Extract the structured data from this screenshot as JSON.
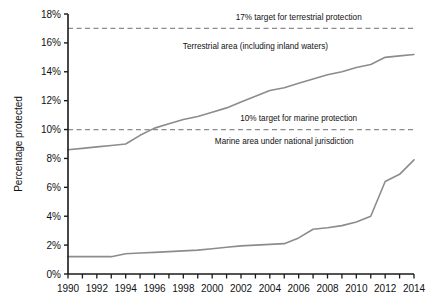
{
  "chart_data": {
    "type": "line",
    "title": "",
    "xlabel": "",
    "ylabel": "Percentage protected",
    "xlim": [
      1990,
      2014
    ],
    "ylim": [
      0,
      18
    ],
    "grid": false,
    "legend_position": "inline-annotations",
    "x": [
      1990,
      1991,
      1992,
      1993,
      1994,
      1995,
      1996,
      1997,
      1998,
      1999,
      2000,
      2001,
      2002,
      2003,
      2004,
      2005,
      2006,
      2007,
      2008,
      2009,
      2010,
      2011,
      2012,
      2013,
      2014
    ],
    "x_tick_labels": [
      "1990",
      "1992",
      "1994",
      "1996",
      "1998",
      "2000",
      "2002",
      "2004",
      "2006",
      "2008",
      "2010",
      "2012",
      "2014"
    ],
    "y_tick_labels": [
      "0%",
      "2%",
      "4%",
      "6%",
      "8%",
      "10%",
      "12%",
      "14%",
      "16%",
      "18%"
    ],
    "y_ticks": [
      0,
      2,
      4,
      6,
      8,
      10,
      12,
      14,
      16,
      18
    ],
    "series": [
      {
        "name": "Terrestrial area (including inland waters)",
        "color": "#8c8c8c",
        "values": [
          8.6,
          8.7,
          8.8,
          8.9,
          9.0,
          9.6,
          10.1,
          10.4,
          10.7,
          10.9,
          11.2,
          11.5,
          11.9,
          12.3,
          12.7,
          12.9,
          13.2,
          13.5,
          13.8,
          14.0,
          14.3,
          14.5,
          15.0,
          15.1,
          15.2
        ]
      },
      {
        "name": "Marine area under national jurisdiction",
        "color": "#8c8c8c",
        "values": [
          1.2,
          1.2,
          1.2,
          1.2,
          1.4,
          1.45,
          1.5,
          1.55,
          1.6,
          1.65,
          1.75,
          1.85,
          1.95,
          2.0,
          2.05,
          2.1,
          2.5,
          3.1,
          3.2,
          3.35,
          3.6,
          4.0,
          6.4,
          6.9,
          7.9
        ]
      }
    ],
    "reference_lines": [
      {
        "name": "17% target for terrestrial protection",
        "value": 17,
        "label": "17% target for terrestrial protection",
        "style": "dashed",
        "color": "#8c8c8c"
      },
      {
        "name": "10% target for marine protection",
        "value": 10,
        "label": "10% target for marine protection",
        "style": "dashed",
        "color": "#8c8c8c"
      }
    ],
    "annotations": [
      {
        "name": "terrestrial-series-label",
        "text": "Terrestrial area (including inland waters)",
        "x": 2003,
        "y": 15.6
      },
      {
        "name": "marine-series-label",
        "text": "Marine area under national jurisdiction",
        "x": 2005,
        "y": 9.0
      },
      {
        "name": "terrestrial-target-label",
        "text": "17% target for terrestrial protection",
        "x": 2006,
        "y": 17.6
      },
      {
        "name": "marine-target-label",
        "text": "10% target for marine protection",
        "x": 2006,
        "y": 10.6
      }
    ]
  },
  "axes": {
    "y_title": "Percentage protected"
  },
  "geometry": {
    "plot_left": 68,
    "plot_right": 414,
    "plot_top": 14,
    "plot_bottom": 274
  }
}
